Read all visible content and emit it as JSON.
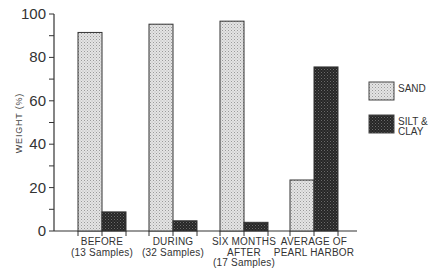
{
  "chart_data": {
    "type": "bar",
    "title": "",
    "xlabel": "",
    "ylabel": "WEIGHT (%)",
    "ylim": [
      0,
      100
    ],
    "y_major_ticks": [
      0,
      20,
      40,
      60,
      80,
      100
    ],
    "y_minor_step": 10,
    "grid": false,
    "legend_position": "right",
    "categories": [
      [
        "BEFORE",
        "(13 Samples)"
      ],
      [
        "DURING",
        "(32 Samples)"
      ],
      [
        "SIX MONTHS",
        "AFTER",
        "(17 Samples)"
      ],
      [
        "AVERAGE OF",
        "PEARL HARBOR"
      ]
    ],
    "series": [
      {
        "name": "SAND",
        "legend_lines": [
          "SAND"
        ],
        "color": "#d6d6d6",
        "values": [
          91.5,
          95.3,
          96.7,
          23.5
        ]
      },
      {
        "name": "SILT & CLAY",
        "legend_lines": [
          "SILT &",
          "CLAY"
        ],
        "color": "#2a2a2a",
        "values": [
          8.8,
          4.7,
          4.0,
          75.6
        ]
      }
    ]
  }
}
